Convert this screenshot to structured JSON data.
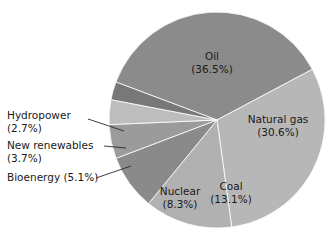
{
  "chart_data": {
    "type": "pie",
    "title": "",
    "subtitle": "",
    "xlabel": "",
    "ylabel": "",
    "legend_position": "none",
    "grid": false,
    "units": "percent",
    "categories": [
      "Oil",
      "Natural gas",
      "Coal",
      "Nuclear",
      "Bioenergy",
      "New renewables",
      "Hydropower"
    ],
    "values": [
      36.5,
      30.6,
      13.1,
      8.3,
      5.1,
      3.7,
      2.7
    ],
    "slices": [
      {
        "name": "Oil",
        "label": "Oil",
        "percent_text": "(36.5%)",
        "value": 36.5,
        "color": "#8b8b8b",
        "label_placement": "inside",
        "label_x": 212,
        "label_y": 57
      },
      {
        "name": "Natural gas",
        "label": "Natural gas",
        "percent_text": "(30.6%)",
        "value": 30.6,
        "color": "#b7b7b7",
        "label_placement": "inside",
        "label_x": 278,
        "label_y": 120
      },
      {
        "name": "Coal",
        "label": "Coal",
        "percent_text": "(13.1%)",
        "value": 13.1,
        "color": "#b1b1b1",
        "label_placement": "inside",
        "label_x": 231,
        "label_y": 187
      },
      {
        "name": "Nuclear",
        "label": "Nuclear",
        "percent_text": "(8.3%)",
        "value": 8.3,
        "color": "#8a8a8a",
        "label_placement": "inside",
        "label_x": 180,
        "label_y": 192
      },
      {
        "name": "Bioenergy",
        "label": "Bioenergy (5.1%)",
        "percent_text": "(5.1%)",
        "value": 5.1,
        "color": "#9b9b9b",
        "label_placement": "callout",
        "label_x": 7,
        "label_y": 178
      },
      {
        "name": "New renewables",
        "label": "New renewables",
        "percent_text": "(3.7%)",
        "value": 3.7,
        "color": "#bdbdbd",
        "label_placement": "callout",
        "label_x": 7,
        "label_y": 146
      },
      {
        "name": "Hydropower",
        "label": "Hydropower",
        "percent_text": "(2.7%)",
        "value": 2.7,
        "color": "#787878",
        "label_placement": "callout",
        "label_x": 7,
        "label_y": 116
      }
    ],
    "geometry": {
      "center_x": 217,
      "center_y": 120,
      "radius": 108,
      "start_angle_deg": -28
    },
    "background_color": "#ffffff",
    "text_color": "#1a1a1a"
  }
}
